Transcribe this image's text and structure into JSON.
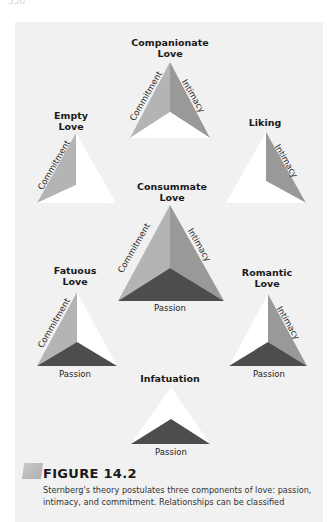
{
  "page": {
    "number": "550"
  },
  "diagram": {
    "components": [
      "Commitment",
      "Intimacy",
      "Passion"
    ],
    "colors": {
      "commitment": "#b4b4b4",
      "intimacy": "#999999",
      "passion": "#4d4d4d",
      "empty": "#ffffff",
      "panel": "#f1f1f1"
    },
    "triangles": [
      {
        "id": "companionate",
        "label_line1": "Companionate",
        "label_line2": "Love",
        "commitment": "Commitment",
        "intimacy": "Intimacy",
        "passion": ""
      },
      {
        "id": "empty",
        "label_line1": "Empty",
        "label_line2": "Love",
        "commitment": "Commitment",
        "intimacy": "",
        "passion": ""
      },
      {
        "id": "liking",
        "label_line1": "Liking",
        "label_line2": "",
        "commitment": "",
        "intimacy": "Intimacy",
        "passion": ""
      },
      {
        "id": "consummate",
        "label_line1": "Consummate",
        "label_line2": "Love",
        "commitment": "Commitment",
        "intimacy": "Intimacy",
        "passion": "Passion"
      },
      {
        "id": "fatuous",
        "label_line1": "Fatuous",
        "label_line2": "Love",
        "commitment": "Commitment",
        "intimacy": "",
        "passion": "Passion"
      },
      {
        "id": "romantic",
        "label_line1": "Romantic",
        "label_line2": "Love",
        "commitment": "",
        "intimacy": "Intimacy",
        "passion": "Passion"
      },
      {
        "id": "infatuation",
        "label_line1": "Infatuation",
        "label_line2": "",
        "commitment": "",
        "intimacy": "",
        "passion": "Passion"
      }
    ]
  },
  "figure": {
    "label": "FIGURE 14.2",
    "caption": "Sternberg's theory postulates three components of love: passion, intimacy, and commitment. Relationships can be classified"
  }
}
